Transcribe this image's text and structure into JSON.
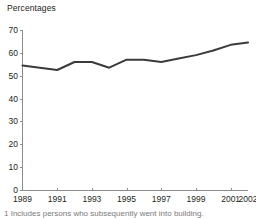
{
  "chart_data": {
    "type": "line",
    "title": "Percentages",
    "xlabel": "",
    "ylabel": "Percentages",
    "ylim": [
      0,
      70
    ],
    "xlim": [
      1989,
      2002
    ],
    "grid": false,
    "legend": "none",
    "line_color": "#3b3b3b",
    "axis_color": "#8c8c8c",
    "x": [
      1989,
      1990,
      1991,
      1992,
      1993,
      1994,
      1995,
      1996,
      1997,
      1998,
      1999,
      2000,
      2001,
      2002
    ],
    "values": [
      54.5,
      53.5,
      52.5,
      56.0,
      56.0,
      53.5,
      57.0,
      57.0,
      56.0,
      57.5,
      59.0,
      61.0,
      63.5,
      64.5
    ],
    "series": [
      {
        "name": "Percentages",
        "values": [
          54.5,
          53.5,
          52.5,
          56.0,
          56.0,
          53.5,
          57.0,
          57.0,
          56.0,
          57.5,
          59.0,
          61.0,
          63.5,
          64.5
        ]
      }
    ],
    "ytick_labels": [
      "70",
      "60",
      "50",
      "40",
      "30",
      "20",
      "10",
      "0"
    ],
    "ytick_values": [
      70,
      60,
      50,
      40,
      30,
      20,
      10,
      0
    ],
    "xtick_labels": [
      "1989",
      "1991",
      "1993",
      "1995",
      "1997",
      "1999",
      "2001",
      "2002"
    ],
    "xtick_values": [
      1989,
      1991,
      1993,
      1995,
      1997,
      1999,
      2001,
      2002
    ]
  },
  "caption": {
    "text": "1 Includes persons who subsequently went into building."
  }
}
